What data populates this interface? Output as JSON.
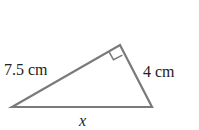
{
  "diagram": {
    "type": "right-triangle",
    "labels": {
      "hypotenuse_side": "7.5 cm",
      "short_leg": "4 cm",
      "base": "x"
    },
    "right_angle_marker": true,
    "line_color": "#7a7a7a",
    "text_color": "#222222"
  }
}
